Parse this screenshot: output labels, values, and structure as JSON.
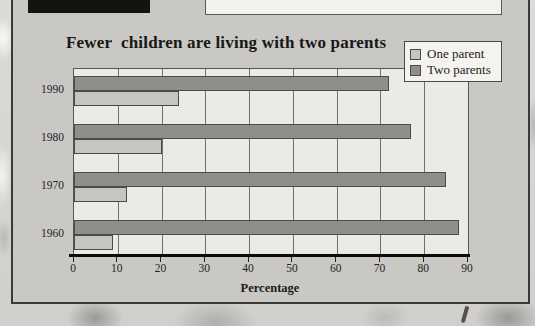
{
  "chart_data": {
    "type": "bar",
    "orientation": "horizontal",
    "title": "Fewer  children are living with two parents",
    "categories": [
      "1990",
      "1980",
      "1970",
      "1960"
    ],
    "series": [
      {
        "name": "One parent",
        "color": "#c6c5c2",
        "values": [
          24,
          20,
          12,
          9
        ]
      },
      {
        "name": "Two parents",
        "color": "#8f8e8b",
        "values": [
          72,
          77,
          85,
          88
        ]
      }
    ],
    "xlabel": "Percentage",
    "xlim": [
      0,
      90
    ],
    "xticks": [
      0,
      10,
      20,
      30,
      40,
      50,
      60,
      70,
      80,
      90
    ],
    "grid": true,
    "legend_position": "top-right",
    "layout": {
      "row_order": [
        "Two parents",
        "One parent"
      ],
      "plot_background": "#ebeae7",
      "panel_background": "#c9c8c5"
    }
  }
}
